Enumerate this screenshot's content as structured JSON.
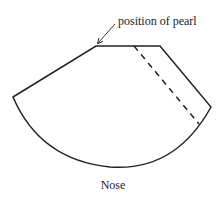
{
  "diagram": {
    "annotation": "position of pearl",
    "caption": "Nose",
    "shape": {
      "outline": "sector-like pattern piece with flat top edge and curved bottom arc",
      "dashed_line": "fold or seam line running from top edge down to the arc"
    },
    "colors": {
      "stroke": "#222222",
      "background": "#ffffff"
    }
  }
}
